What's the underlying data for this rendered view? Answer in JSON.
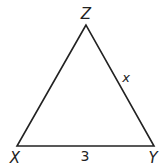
{
  "diagram": {
    "type": "triangle",
    "stroke_color": "#222222",
    "background": "#ffffff",
    "vertices": [
      {
        "name": "Z",
        "label": "Z",
        "x": 86,
        "y": 25
      },
      {
        "name": "X",
        "label": "X",
        "x": 17,
        "y": 146
      },
      {
        "name": "Y",
        "label": "Y",
        "x": 154,
        "y": 146
      }
    ],
    "sides": [
      {
        "from": "X",
        "to": "Y",
        "label": "3"
      },
      {
        "from": "Z",
        "to": "Y",
        "label": "x"
      },
      {
        "from": "X",
        "to": "Z",
        "label": ""
      }
    ]
  }
}
